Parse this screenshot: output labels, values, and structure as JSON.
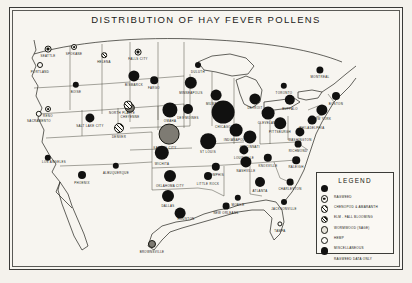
{
  "figure": {
    "title": "DISTRIBUTION OF HAY FEVER POLLENS",
    "medium": "halftone map plate",
    "frame_color": "#3a3a38",
    "paper_color": "#f7f5f0",
    "ink_color": "#15150f"
  },
  "legend": {
    "title": "LEGEND",
    "entries": [
      {
        "label": "RAGWEED",
        "symbol": "solid-black-disc",
        "style": "s-ragweed"
      },
      {
        "label": "CHENOPOD & AMARANTH",
        "symbol": "ringed-disc",
        "style": "s-ring"
      },
      {
        "label": "ELM - FALL BLOOMING",
        "symbol": "cross-hatched-disc",
        "style": "s-cross"
      },
      {
        "label": "WORMWOOD (SAGE)",
        "symbol": "hatched-disc",
        "style": "s-hatch"
      },
      {
        "label": "HEMP",
        "symbol": "stippled-disc",
        "style": "s-dots"
      },
      {
        "label": "MISCELLANEOUS",
        "symbol": "open-disc",
        "style": "s-open"
      },
      {
        "label": "RAGWEED DATA ONLY",
        "symbol": "solid-black-disc",
        "style": "s-ragweed"
      }
    ]
  },
  "chart_data": {
    "type": "map",
    "title": "DISTRIBUTION OF HAY FEVER POLLENS",
    "region": "United States, southern Canada and northern Mexico",
    "encoding": {
      "mark": "proportional circle / divided pie",
      "size_means": "relative atmospheric pollen concentration",
      "fill_means": "pollen type per legend"
    },
    "cities": [
      {
        "name": "SEATTLE",
        "x": 36,
        "y": 39,
        "r": 3.4,
        "style": "s-ring",
        "label_dx": 0,
        "label_dy": 5
      },
      {
        "name": "SPOKANE",
        "x": 62,
        "y": 37,
        "r": 3.0,
        "style": "s-ring",
        "label_dx": 0,
        "label_dy": 5
      },
      {
        "name": "PORTLAND",
        "x": 28,
        "y": 55,
        "r": 3.0,
        "style": "s-open",
        "label_dx": 0,
        "label_dy": 5
      },
      {
        "name": "BOISE",
        "x": 64,
        "y": 75,
        "r": 3.2,
        "style": "s-ragweed",
        "label_dx": 0,
        "label_dy": 5
      },
      {
        "name": "HELENA",
        "x": 92,
        "y": 45,
        "r": 2.8,
        "style": "s-hatch",
        "label_dx": 0,
        "label_dy": 5
      },
      {
        "name": "FALLS CITY",
        "x": 126,
        "y": 42,
        "r": 3.4,
        "style": "s-ring",
        "label_dx": 0,
        "label_dy": 5
      },
      {
        "name": "RENO",
        "x": 36,
        "y": 99,
        "r": 3.0,
        "style": "s-ring",
        "label_dx": 0,
        "label_dy": 5
      },
      {
        "name": "SACRAMENTO",
        "x": 27,
        "y": 104,
        "r": 3.2,
        "style": "s-open",
        "label_dx": 0,
        "label_dy": 5
      },
      {
        "name": "SALT LAKE CITY",
        "x": 78,
        "y": 108,
        "r": 4.6,
        "style": "s-ragweed",
        "label_dx": 0,
        "label_dy": 6
      },
      {
        "name": "CHEYENNE",
        "x": 118,
        "y": 98,
        "r": 5.2,
        "style": "s-grey",
        "label_dx": 0,
        "label_dy": 7
      },
      {
        "name": "DENVER",
        "x": 107,
        "y": 118,
        "r": 5.0,
        "style": "s-cross",
        "label_dx": 0,
        "label_dy": 7
      },
      {
        "name": "LOS ANGELES",
        "x": 36,
        "y": 148,
        "r": 3.2,
        "style": "s-ragweed",
        "label_dx": 6,
        "label_dy": 2
      },
      {
        "name": "PHOENIX",
        "x": 70,
        "y": 165,
        "r": 4.0,
        "style": "s-ragweed",
        "label_dx": 0,
        "label_dy": 6
      },
      {
        "name": "ALBUQUERQUE",
        "x": 104,
        "y": 156,
        "r": 3.2,
        "style": "s-ragweed",
        "label_dx": 0,
        "label_dy": 5
      },
      {
        "name": "FARGO",
        "x": 142,
        "y": 70,
        "r": 3.8,
        "style": "s-ragweed",
        "label_dx": 0,
        "label_dy": 6
      },
      {
        "name": "BISMARCK",
        "x": 122,
        "y": 66,
        "r": 5.6,
        "style": "s-ragweed",
        "label_dx": 0,
        "label_dy": 7
      },
      {
        "name": "MINNEAPOLIS",
        "x": 179,
        "y": 73,
        "r": 6.2,
        "style": "s-ragweed",
        "label_dx": 0,
        "label_dy": 8
      },
      {
        "name": "DULUTH",
        "x": 186,
        "y": 55,
        "r": 3.0,
        "style": "s-ragweed",
        "label_dx": 0,
        "label_dy": 5
      },
      {
        "name": "NORTH PLATTE",
        "x": 116,
        "y": 95,
        "r": 4.4,
        "style": "s-cross",
        "label_dx": -6,
        "label_dy": 6
      },
      {
        "name": "OMAHA",
        "x": 158,
        "y": 100,
        "r": 7.6,
        "style": "s-ragweed",
        "label_dx": 0,
        "label_dy": 9
      },
      {
        "name": "DES MOINES",
        "x": 176,
        "y": 99,
        "r": 5.0,
        "style": "s-ragweed",
        "label_dx": 0,
        "label_dy": 7
      },
      {
        "name": "KANSAS CITY",
        "x": 157,
        "y": 124,
        "r": 10.4,
        "style": "s-grey",
        "label_dx": -4,
        "label_dy": 12
      },
      {
        "name": "WICHITA",
        "x": 150,
        "y": 143,
        "r": 7.2,
        "style": "s-ragweed",
        "label_dx": 0,
        "label_dy": 9
      },
      {
        "name": "ST LOUIS",
        "x": 196,
        "y": 131,
        "r": 7.8,
        "style": "s-ragweed",
        "label_dx": 0,
        "label_dy": 9
      },
      {
        "name": "CHICAGO",
        "x": 211,
        "y": 102,
        "r": 11.4,
        "style": "s-ragweed",
        "label_dx": 0,
        "label_dy": 13
      },
      {
        "name": "MILWAUKEE",
        "x": 204,
        "y": 85,
        "r": 5.4,
        "style": "s-ragweed",
        "label_dx": 0,
        "label_dy": 7
      },
      {
        "name": "INDIANAPOLIS",
        "x": 224,
        "y": 120,
        "r": 6.4,
        "style": "s-ragweed",
        "label_dx": 0,
        "label_dy": 8
      },
      {
        "name": "CINCINNATI",
        "x": 238,
        "y": 127,
        "r": 6.6,
        "style": "s-ragweed",
        "label_dx": 0,
        "label_dy": 8
      },
      {
        "name": "CLEVELAND",
        "x": 256,
        "y": 103,
        "r": 6.4,
        "style": "s-ragweed",
        "label_dx": 0,
        "label_dy": 8
      },
      {
        "name": "DETROIT",
        "x": 243,
        "y": 89,
        "r": 5.6,
        "style": "s-ragweed",
        "label_dx": 0,
        "label_dy": 7
      },
      {
        "name": "BUFFALO",
        "x": 278,
        "y": 90,
        "r": 5.2,
        "style": "s-ragweed",
        "label_dx": 0,
        "label_dy": 7
      },
      {
        "name": "PITTSBURGH",
        "x": 268,
        "y": 113,
        "r": 5.8,
        "style": "s-ragweed",
        "label_dx": 0,
        "label_dy": 7
      },
      {
        "name": "TORONTO",
        "x": 272,
        "y": 76,
        "r": 3.2,
        "style": "s-ragweed",
        "label_dx": 0,
        "label_dy": 5
      },
      {
        "name": "MONTREAL",
        "x": 308,
        "y": 60,
        "r": 3.6,
        "style": "s-ragweed",
        "label_dx": 0,
        "label_dy": 5
      },
      {
        "name": "BOSTON",
        "x": 324,
        "y": 86,
        "r": 4.0,
        "style": "s-ragweed",
        "label_dx": 0,
        "label_dy": 6
      },
      {
        "name": "NEW YORK",
        "x": 310,
        "y": 100,
        "r": 5.6,
        "style": "s-ragweed",
        "label_dx": 0,
        "label_dy": 7
      },
      {
        "name": "PHILADELPHIA",
        "x": 300,
        "y": 110,
        "r": 4.4,
        "style": "s-ragweed",
        "label_dx": 0,
        "label_dy": 6
      },
      {
        "name": "WASHINGTON",
        "x": 288,
        "y": 122,
        "r": 4.6,
        "style": "s-ragweed",
        "label_dx": 0,
        "label_dy": 6
      },
      {
        "name": "RICHMOND",
        "x": 286,
        "y": 134,
        "r": 3.4,
        "style": "s-ragweed",
        "label_dx": 0,
        "label_dy": 5
      },
      {
        "name": "LOUISVILLE",
        "x": 232,
        "y": 140,
        "r": 4.6,
        "style": "s-ragweed",
        "label_dx": 0,
        "label_dy": 6
      },
      {
        "name": "NASHVILLE",
        "x": 234,
        "y": 152,
        "r": 5.6,
        "style": "s-ragweed",
        "label_dx": 0,
        "label_dy": 7
      },
      {
        "name": "KNOXVILLE",
        "x": 256,
        "y": 148,
        "r": 4.2,
        "style": "s-ragweed",
        "label_dx": 0,
        "label_dy": 6
      },
      {
        "name": "RALEIGH",
        "x": 284,
        "y": 150,
        "r": 3.8,
        "style": "s-ragweed",
        "label_dx": 0,
        "label_dy": 5
      },
      {
        "name": "MEMPHIS",
        "x": 204,
        "y": 157,
        "r": 4.2,
        "style": "s-ragweed",
        "label_dx": 0,
        "label_dy": 6
      },
      {
        "name": "LITTLE ROCK",
        "x": 196,
        "y": 166,
        "r": 4.0,
        "style": "s-ragweed",
        "label_dx": 0,
        "label_dy": 6
      },
      {
        "name": "OKLAHOMA CITY",
        "x": 158,
        "y": 166,
        "r": 6.0,
        "style": "s-ragweed",
        "label_dx": 0,
        "label_dy": 8
      },
      {
        "name": "DALLAS",
        "x": 156,
        "y": 186,
        "r": 6.0,
        "style": "s-ragweed",
        "label_dx": 0,
        "label_dy": 8
      },
      {
        "name": "ATLANTA",
        "x": 248,
        "y": 172,
        "r": 5.0,
        "style": "s-ragweed",
        "label_dx": 0,
        "label_dy": 7
      },
      {
        "name": "CHARLESTON",
        "x": 278,
        "y": 172,
        "r": 3.4,
        "style": "s-ragweed",
        "label_dx": 0,
        "label_dy": 5
      },
      {
        "name": "MOBILE",
        "x": 226,
        "y": 188,
        "r": 3.2,
        "style": "s-ragweed",
        "label_dx": 0,
        "label_dy": 5
      },
      {
        "name": "NEW ORLEANS",
        "x": 214,
        "y": 196,
        "r": 3.4,
        "style": "s-ragweed",
        "label_dx": 0,
        "label_dy": 5
      },
      {
        "name": "JACKSONVILLE",
        "x": 272,
        "y": 192,
        "r": 3.0,
        "style": "s-ragweed",
        "label_dx": 0,
        "label_dy": 5
      },
      {
        "name": "HOUSTON",
        "x": 168,
        "y": 203,
        "r": 5.4,
        "style": "s-ragweed",
        "label_dx": 6,
        "label_dy": 4
      },
      {
        "name": "TAMPA",
        "x": 268,
        "y": 214,
        "r": 2.6,
        "style": "s-open",
        "label_dx": 0,
        "label_dy": 5
      },
      {
        "name": "BROWNSVILLE",
        "x": 140,
        "y": 234,
        "r": 4.0,
        "style": "s-grey",
        "label_dx": 0,
        "label_dy": 6
      }
    ]
  }
}
